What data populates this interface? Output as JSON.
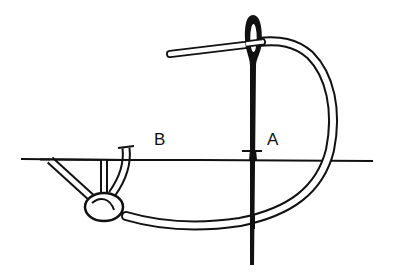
{
  "diagram": {
    "type": "stitch-illustration",
    "labels": {
      "point_a": "A",
      "point_b": "B"
    },
    "elements": {
      "fabric_line": "fabric-surface-line",
      "needle": "sewing-needle",
      "thread": "thread",
      "knot": "french-knot"
    },
    "colors": {
      "ink": "#111111",
      "background": "#ffffff",
      "thread_fill": "#ffffff"
    }
  }
}
